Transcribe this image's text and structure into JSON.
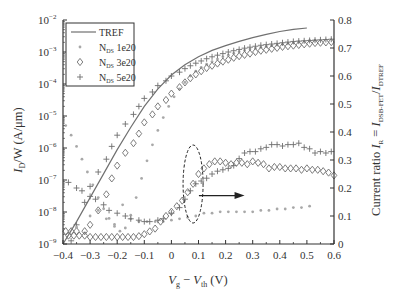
{
  "chart_data": {
    "type": "scatter",
    "title": "",
    "xlabel": "V_g − V_th (V)",
    "xlabel_parts": {
      "v1": "V",
      "s1": "g",
      "minus": " − ",
      "v2": "V",
      "s2": "th",
      "unit": " (V)"
    },
    "ylabel_left": "I_D/W (A/μm)",
    "ylabel_left_parts": {
      "v": "I",
      "s": "D",
      "rest": "/W (A/μm)"
    },
    "ylabel_right": "Current ratio I_R = I_DSB-FET/I_DTREF",
    "ylabel_right_parts": {
      "pre": "Current ratio ",
      "v1": "I",
      "s1": "R",
      "eq": " = ",
      "v2": "I",
      "s2": "DSB-FET",
      "slash": "/",
      "v3": "I",
      "s3": "DTREF"
    },
    "xlim": [
      -0.4,
      0.6
    ],
    "ylim_left_log10": [
      -9,
      -2
    ],
    "ylim_right": [
      0,
      0.8
    ],
    "x_ticks": [
      "-0.4",
      "−0.3",
      "−0.2",
      "−0.1",
      "0",
      "0.1",
      "0.2",
      "0.3",
      "0.4",
      "0.5",
      "0.6"
    ],
    "x_tick_labels": [
      "−0.4",
      "−0.3",
      "−0.2",
      "−0.1",
      "0",
      "0.1",
      "0.2",
      "0.3",
      "0.4",
      "0.5",
      "0.6"
    ],
    "y_left_ticks": [
      {
        "base": "10",
        "exp": "−2"
      },
      {
        "base": "10",
        "exp": "−3"
      },
      {
        "base": "10",
        "exp": "−4"
      },
      {
        "base": "10",
        "exp": "−5"
      },
      {
        "base": "10",
        "exp": "−6"
      },
      {
        "base": "10",
        "exp": "−7"
      },
      {
        "base": "10",
        "exp": "−8"
      },
      {
        "base": "10",
        "exp": "−9"
      }
    ],
    "y_right_ticks": [
      "0.8",
      "0.7",
      "0.6",
      "0.5",
      "0.4",
      "0.3",
      "0.2",
      "0.1",
      "0"
    ],
    "grid": false,
    "legend": {
      "position": "upper-left",
      "entries": [
        {
          "label": "TREF",
          "marker": "line"
        },
        {
          "label": "N",
          "sub": "DS",
          "suffix": " 1e20",
          "marker": "asterisk"
        },
        {
          "label": "N",
          "sub": "DS",
          "suffix": " 3e20",
          "marker": "diamond"
        },
        {
          "label": "N",
          "sub": "DS",
          "suffix": " 5e20",
          "marker": "plus"
        }
      ]
    },
    "series": [
      {
        "name": "TREF",
        "axis": "left",
        "style": "line",
        "x": [
          -0.4,
          -0.35,
          -0.3,
          -0.25,
          -0.2,
          -0.15,
          -0.1,
          -0.05,
          0.0,
          0.05,
          0.1,
          0.15,
          0.2,
          0.25,
          0.3,
          0.35,
          0.4,
          0.45,
          0.5
        ],
        "log10_y": [
          -9.0,
          -8.3,
          -7.55,
          -6.8,
          -6.05,
          -5.35,
          -4.7,
          -4.15,
          -3.72,
          -3.4,
          -3.15,
          -2.95,
          -2.8,
          -2.67,
          -2.55,
          -2.45,
          -2.36,
          -2.29,
          -2.25
        ]
      },
      {
        "name": "N_DS 1e20 (current)",
        "axis": "left",
        "style": "asterisk",
        "x": [
          -0.39,
          -0.37,
          -0.35,
          -0.33,
          -0.31,
          -0.29,
          -0.27,
          -0.25,
          -0.23,
          -0.21,
          -0.19,
          -0.17,
          -0.15,
          -0.13,
          -0.11,
          -0.09,
          -0.07,
          -0.05,
          -0.03,
          -0.01,
          0.01,
          0.03,
          0.05,
          0.07,
          0.09,
          0.11,
          0.13,
          0.15,
          0.17,
          0.19,
          0.21,
          0.23,
          0.25,
          0.27,
          0.29,
          0.31,
          0.33,
          0.35,
          0.37,
          0.39,
          0.41,
          0.43,
          0.45,
          0.47,
          0.49,
          0.51,
          0.53
        ],
        "log10_y": [
          -5.3,
          -5.6,
          -5.95,
          -6.35,
          -6.75,
          -7.15,
          -7.55,
          -7.9,
          -8.2,
          -8.45,
          -8.6,
          -8.5,
          -8.1,
          -7.55,
          -6.95,
          -6.4,
          -5.9,
          -5.45,
          -5.05,
          -4.7,
          -4.4,
          -4.15,
          -3.95,
          -3.75,
          -3.6,
          -3.48,
          -3.38,
          -3.3,
          -3.22,
          -3.15,
          -3.1,
          -3.04,
          -2.99,
          -2.95,
          -2.91,
          -2.88,
          -2.85,
          -2.82,
          -2.79,
          -2.77,
          -2.75,
          -2.72,
          -2.7,
          -2.68,
          -2.66,
          -2.64,
          -2.63
        ]
      },
      {
        "name": "N_DS 3e20 (current)",
        "axis": "left",
        "style": "diamond",
        "x": [
          -0.39,
          -0.37,
          -0.35,
          -0.32,
          -0.3,
          -0.27,
          -0.24,
          -0.22,
          -0.2,
          -0.17,
          -0.14,
          -0.12,
          -0.1,
          -0.07,
          -0.05,
          -0.02,
          0.0,
          0.03,
          0.05,
          0.07,
          0.09,
          0.11,
          0.13,
          0.15,
          0.17,
          0.19,
          0.21,
          0.23,
          0.25,
          0.27,
          0.29,
          0.31,
          0.33,
          0.35,
          0.37,
          0.39,
          0.41,
          0.43,
          0.45,
          0.47,
          0.49,
          0.51,
          0.53,
          0.55,
          0.57,
          0.59
        ],
        "log10_y": [
          -8.6,
          -8.6,
          -8.6,
          -8.6,
          -8.4,
          -7.95,
          -7.45,
          -6.95,
          -6.55,
          -6.15,
          -5.85,
          -5.55,
          -5.2,
          -4.95,
          -4.7,
          -4.5,
          -4.3,
          -4.1,
          -3.95,
          -3.82,
          -3.7,
          -3.6,
          -3.5,
          -3.43,
          -3.36,
          -3.3,
          -3.24,
          -3.18,
          -3.13,
          -3.09,
          -3.05,
          -3.0,
          -2.96,
          -2.93,
          -2.9,
          -2.87,
          -2.84,
          -2.82,
          -2.8,
          -2.78,
          -2.76,
          -2.74,
          -2.72,
          -2.71,
          -2.7,
          -2.69
        ]
      },
      {
        "name": "N_DS 5e20 (current)",
        "axis": "left",
        "style": "plus",
        "x": [
          -0.37,
          -0.35,
          -0.32,
          -0.3,
          -0.27,
          -0.24,
          -0.22,
          -0.2,
          -0.17,
          -0.14,
          -0.12,
          -0.1,
          -0.07,
          -0.05,
          -0.02,
          0.0,
          0.03,
          0.05,
          0.07,
          0.09,
          0.11,
          0.13,
          0.15,
          0.17,
          0.19,
          0.21,
          0.23,
          0.25,
          0.27,
          0.29,
          0.31,
          0.33,
          0.35,
          0.37,
          0.39,
          0.41,
          0.43,
          0.45,
          0.47,
          0.49,
          0.51,
          0.53,
          0.55,
          0.57,
          0.59
        ],
        "log10_y": [
          -8.9,
          -8.4,
          -7.7,
          -7.2,
          -6.75,
          -6.35,
          -5.95,
          -5.6,
          -5.25,
          -4.95,
          -4.7,
          -4.45,
          -4.25,
          -4.05,
          -3.9,
          -3.75,
          -3.63,
          -3.52,
          -3.43,
          -3.35,
          -3.28,
          -3.21,
          -3.15,
          -3.1,
          -3.05,
          -3.0,
          -2.96,
          -2.92,
          -2.88,
          -2.85,
          -2.82,
          -2.79,
          -2.77,
          -2.75,
          -2.73,
          -2.71,
          -2.69,
          -2.67,
          -2.66,
          -2.65,
          -2.64,
          -2.63,
          -2.62,
          -2.61,
          -2.6
        ]
      },
      {
        "name": "N_DS 1e20 (ratio)",
        "axis": "right",
        "style": "asterisk",
        "x": [
          -0.38,
          -0.35,
          -0.32,
          -0.3,
          -0.27,
          -0.24,
          -0.21,
          -0.18,
          -0.15,
          -0.12,
          -0.09,
          -0.06,
          -0.03,
          0.0,
          0.03,
          0.06,
          0.09,
          0.12,
          0.15,
          0.18,
          0.21,
          0.24,
          0.27,
          0.3,
          0.33,
          0.36,
          0.39,
          0.42,
          0.45,
          0.48,
          0.51
        ],
        "y": [
          0.04,
          0.06,
          0.04,
          0.1,
          0.12,
          0.09,
          0.07,
          0.14,
          0.09,
          0.08,
          0.08,
          0.08,
          0.08,
          0.085,
          0.09,
          0.095,
          0.1,
          0.11,
          0.11,
          0.115,
          0.115,
          0.115,
          0.115,
          0.115,
          0.12,
          0.12,
          0.125,
          0.125,
          0.13,
          0.13,
          0.135
        ]
      },
      {
        "name": "N_DS 3e20 (ratio)",
        "axis": "right",
        "style": "diamond",
        "x": [
          -0.38,
          -0.36,
          -0.34,
          -0.32,
          -0.3,
          -0.28,
          -0.26,
          -0.24,
          -0.22,
          -0.2,
          -0.18,
          -0.16,
          -0.14,
          -0.12,
          -0.1,
          -0.08,
          -0.06,
          -0.04,
          -0.02,
          0.0,
          0.02,
          0.04,
          0.06,
          0.08,
          0.1,
          0.12,
          0.14,
          0.16,
          0.18,
          0.2,
          0.22,
          0.24,
          0.26,
          0.28,
          0.3,
          0.32,
          0.34,
          0.36,
          0.38,
          0.4,
          0.42,
          0.44,
          0.46,
          0.48,
          0.5,
          0.52,
          0.54,
          0.56,
          0.58,
          0.6
        ],
        "y": [
          0.03,
          0.03,
          0.03,
          0.03,
          0.025,
          0.025,
          0.025,
          0.025,
          0.025,
          0.025,
          0.025,
          0.025,
          0.025,
          0.028,
          0.035,
          0.045,
          0.055,
          0.08,
          0.1,
          0.115,
          0.135,
          0.155,
          0.185,
          0.215,
          0.25,
          0.27,
          0.285,
          0.295,
          0.295,
          0.29,
          0.285,
          0.29,
          0.29,
          0.285,
          0.295,
          0.29,
          0.285,
          0.27,
          0.275,
          0.275,
          0.27,
          0.27,
          0.27,
          0.265,
          0.27,
          0.265,
          0.265,
          0.26,
          0.255,
          0.245
        ]
      },
      {
        "name": "N_DS 5e20 (ratio)",
        "axis": "right",
        "style": "plus",
        "x": [
          -0.38,
          -0.35,
          -0.33,
          -0.3,
          -0.28,
          -0.25,
          -0.23,
          -0.2,
          -0.17,
          -0.15,
          -0.12,
          -0.1,
          -0.08,
          -0.05,
          -0.03,
          0.0,
          0.03,
          0.05,
          0.07,
          0.09,
          0.11,
          0.13,
          0.15,
          0.17,
          0.19,
          0.21,
          0.23,
          0.25,
          0.27,
          0.29,
          0.31,
          0.33,
          0.35,
          0.37,
          0.39,
          0.41,
          0.43,
          0.45,
          0.47,
          0.49,
          0.51,
          0.53,
          0.55,
          0.57,
          0.59
        ],
        "y": [
          0.22,
          0.2,
          0.19,
          0.17,
          0.16,
          0.14,
          0.12,
          0.11,
          0.1,
          0.09,
          0.085,
          0.08,
          0.08,
          0.085,
          0.09,
          0.11,
          0.13,
          0.16,
          0.19,
          0.215,
          0.225,
          0.235,
          0.25,
          0.26,
          0.265,
          0.27,
          0.28,
          0.305,
          0.325,
          0.33,
          0.33,
          0.34,
          0.345,
          0.355,
          0.355,
          0.35,
          0.355,
          0.355,
          0.36,
          0.345,
          0.34,
          0.325,
          0.33,
          0.325,
          0.33
        ]
      }
    ],
    "annotations": [
      {
        "type": "dashed-ellipse",
        "cx": 0.08,
        "cy_right": 0.2,
        "note": "highlights ratio curves near V_g − V_th ≈ 0.08 V"
      },
      {
        "type": "arrow",
        "from_x": 0.12,
        "to_x": 0.27,
        "y_right": 0.18,
        "direction": "right",
        "note": "points toward right axis (current ratio)"
      }
    ]
  },
  "style": {
    "line_color": "#707070",
    "marker_color": "#6e6e6e",
    "light_marker_color": "#a8a8a8",
    "axis_color": "#333333",
    "background": "#ffffff"
  }
}
